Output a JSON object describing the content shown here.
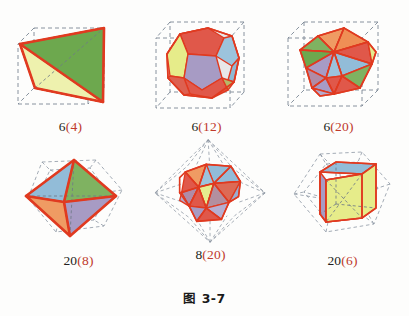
{
  "figure": {
    "caption": "图 3-7",
    "caption_prefix": "图",
    "caption_number": "3-7"
  },
  "palette": {
    "edge_red": "#e03a20",
    "cage_gray": "#7b8794",
    "face_green_dark": "#6aa84f",
    "face_green_light": "#8cc06a",
    "face_yellow": "#e6ec8a",
    "face_yellow_deep": "#ddd96a",
    "face_red": "#e0584a",
    "face_orange": "#ef9b63",
    "face_blue": "#92bcd8",
    "face_purple": "#a79bc4",
    "face_mauve": "#b08ba6",
    "label_black": "#231f20",
    "label_red": "#c0392b",
    "background": "#fdfdfc"
  },
  "items": [
    {
      "id": "tetrahedron-in-cube",
      "outer_count": "6",
      "inner_count": "(4)",
      "label": "6(4)",
      "outer_solid": "cube",
      "inner_solid": "tetrahedron"
    },
    {
      "id": "dodecahedron-in-cube",
      "outer_count": "6",
      "inner_count": "(12)",
      "label": "6(12)",
      "outer_solid": "cube",
      "inner_solid": "dodecahedron"
    },
    {
      "id": "icosahedron-in-cube",
      "outer_count": "6",
      "inner_count": "(20)",
      "label": "6(20)",
      "outer_solid": "cube",
      "inner_solid": "icosahedron"
    },
    {
      "id": "octahedron-in-dodecahedron",
      "outer_count": "20",
      "inner_count": "(8)",
      "label": "20(8)",
      "outer_solid": "dodecahedron",
      "inner_solid": "octahedron"
    },
    {
      "id": "icosahedron-in-octahedron",
      "outer_count": "8",
      "inner_count": "(20)",
      "label": "8(20)",
      "outer_solid": "octahedron",
      "inner_solid": "icosahedron"
    },
    {
      "id": "cube-in-dodecahedron",
      "outer_count": "20",
      "inner_count": "(6)",
      "label": "20(6)",
      "outer_solid": "dodecahedron",
      "inner_solid": "cube"
    }
  ]
}
